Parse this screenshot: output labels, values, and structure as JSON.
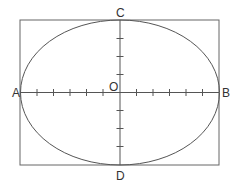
{
  "diagram": {
    "type": "ellipse-in-rectangle",
    "labels": {
      "left": "A",
      "right": "B",
      "top": "C",
      "bottom": "D",
      "origin": "O"
    },
    "horizontal_ticks_per_side": 5,
    "vertical_ticks_per_side": 3,
    "colors": {
      "stroke": "#555555",
      "background": "#ffffff",
      "text": "#333333"
    }
  }
}
